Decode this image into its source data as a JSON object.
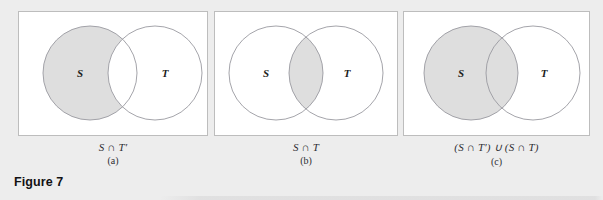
{
  "figure": {
    "title": "Figure 7",
    "background_color": "#ededed",
    "panel_fill": "#ffffff",
    "panel_border_color": "#bdbdbd",
    "circle_stroke_color": "#9a9aa0",
    "shade_color": "#dedede",
    "panel_count": 3
  },
  "panels": [
    {
      "id": "a",
      "label": "(a)",
      "expression": "S ∩ T′",
      "expr_parts": {
        "left": "S",
        "op": "∩",
        "right": "T′"
      },
      "shaded_region": "S-minus-T",
      "shaded_description": "the part of S outside T",
      "circles": [
        {
          "name": "S",
          "label": "S",
          "cx": 72,
          "cy": 62,
          "r": 47,
          "filled": true
        },
        {
          "name": "T",
          "label": "T",
          "cx": 137,
          "cy": 62,
          "r": 47,
          "filled": false
        }
      ]
    },
    {
      "id": "b",
      "label": "(b)",
      "expression": "S ∩ T",
      "expr_parts": {
        "left": "S",
        "op": "∩",
        "right": "T"
      },
      "shaded_region": "S-intersect-T",
      "shaded_description": "the lens-shaped overlap of S and T",
      "circles": [
        {
          "name": "S",
          "label": "S",
          "cx": 62,
          "cy": 62,
          "r": 47,
          "filled": false
        },
        {
          "name": "T",
          "label": "T",
          "cx": 122,
          "cy": 62,
          "r": 47,
          "filled": false
        }
      ]
    },
    {
      "id": "c",
      "label": "(c)",
      "expression": "(S ∩ T′) ∪ (S ∩ T)",
      "expr_parts": {
        "left": "(S ∩ T′)",
        "op": "∪",
        "right": "(S ∩ T)"
      },
      "shaded_region": "S-entire",
      "shaded_description": "the whole circle S, including the overlap",
      "circles": [
        {
          "name": "S",
          "label": "S",
          "cx": 68,
          "cy": 62,
          "r": 47,
          "filled": true
        },
        {
          "name": "T",
          "label": "T",
          "cx": 130,
          "cy": 62,
          "r": 47,
          "filled": false
        }
      ]
    }
  ]
}
